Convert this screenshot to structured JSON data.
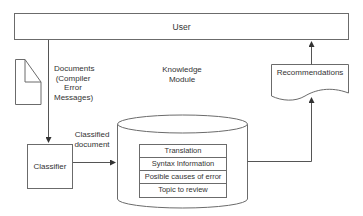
{
  "diagram": {
    "user": {
      "label": "User"
    },
    "document_label": {
      "lines": [
        "Documents",
        "(Compiler",
        "Error",
        "Messages)"
      ]
    },
    "knowledge_module": {
      "lines": [
        "Knowledge",
        "Module"
      ]
    },
    "recommendations": {
      "label": "Recommendations"
    },
    "classified_document": {
      "lines": [
        "Classified",
        "document"
      ]
    },
    "classifier": {
      "label": "Classifier"
    },
    "knowledge_items": [
      {
        "label": "Translation"
      },
      {
        "label": "Syntax Information"
      },
      {
        "label": "Posible causes of error"
      },
      {
        "label": "Topic to review"
      }
    ],
    "colors": {
      "stroke": "#6b6b6b",
      "text": "#333333",
      "background": "#ffffff"
    }
  }
}
